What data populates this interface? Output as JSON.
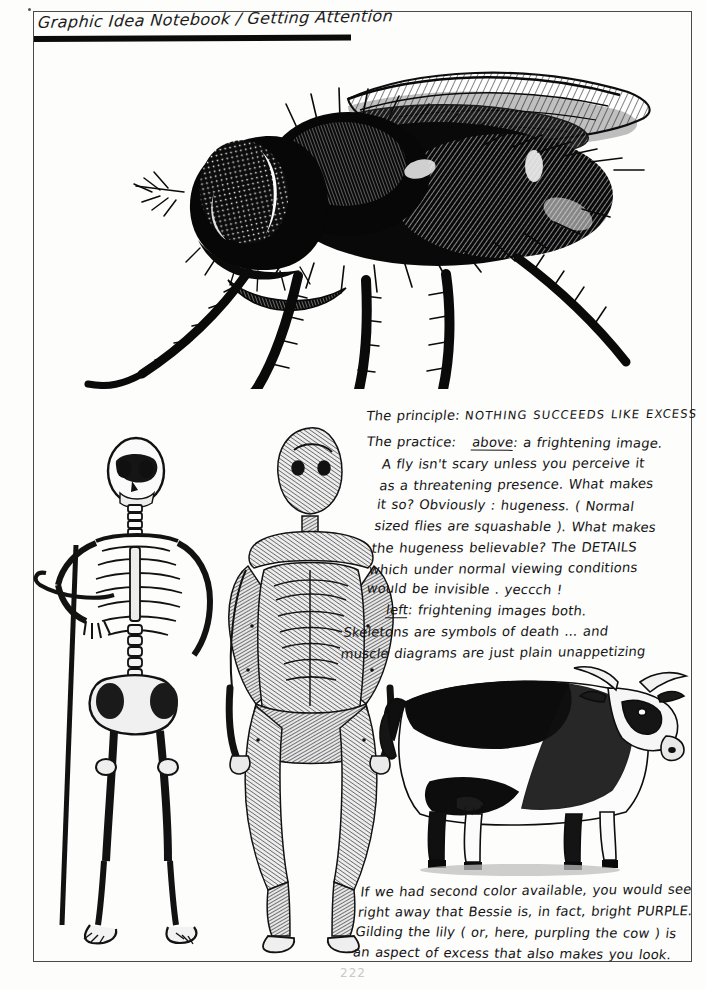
{
  "page": {
    "title": "Graphic Idea Notebook / Getting Attention",
    "page_number": "222",
    "ink_color": "#141414",
    "paper_color": "#fdfdfc",
    "frame_color": "#4a4a4a"
  },
  "principle": {
    "label": "The principle:",
    "statement": "NOTHING SUCCEEDS LIKE EXCESS"
  },
  "practice": {
    "label": "The practice:",
    "above_keyword": "above",
    "lines": [
      "above:  a frightening image.",
      "A fly isn't scary unless you perceive it",
      "as a threatening presence. What makes",
      "it so?  Obviously : hugeness. ( Normal",
      "sized flies are squashable ). What makes",
      "the hugeness believable?  The DETAILS",
      "which under normal viewing conditions",
      "would be invisible .   yeccch !"
    ],
    "left_keyword": "left",
    "left_lines": [
      "left: frightening images both.",
      "Skeletons are symbols of death ... and",
      "muscle diagrams are just plain unappetizing"
    ]
  },
  "bottom_note": {
    "lines": [
      "If we had second color available, you would see",
      "right away that Bessie is, in fact, bright PURPLE.",
      "Gilding the lily ( or, here, purpling the cow ) is",
      "an aspect of excess that also makes you look."
    ]
  },
  "illustrations": [
    {
      "id": "fly",
      "name": "giant-fly-engraving",
      "caption": "a frightening image — enormously magnified housefly in profile"
    },
    {
      "id": "skeleton",
      "name": "human-skeleton-engraving",
      "caption": "anatomical skeleton leaning on a staff"
    },
    {
      "id": "muscle",
      "name": "muscle-ecorche-engraving",
      "caption": "écorché muscle diagram of standing male figure"
    },
    {
      "id": "cow",
      "name": "cow-engraving",
      "caption": "Bessie the horned cow in profile"
    }
  ]
}
